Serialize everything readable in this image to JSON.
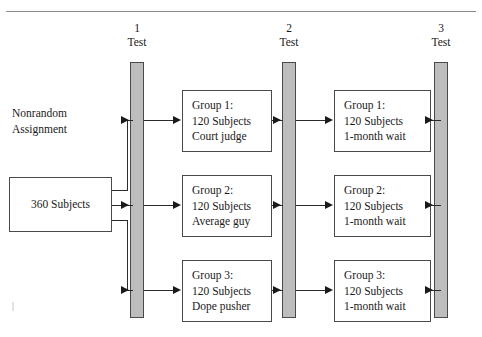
{
  "page": {
    "ghost_text": "                                        "
  },
  "columns": [
    {
      "number": "1",
      "label": "Test"
    },
    {
      "number": "2",
      "label": "Test"
    },
    {
      "number": "3",
      "label": "Test"
    }
  ],
  "left": {
    "assignment_label": "Nonrandom\nAssignment",
    "subjects_box": "360 Subjects"
  },
  "stage1": [
    {
      "line1": "Group 1:",
      "line2": "120 Subjects",
      "line3": "Court judge"
    },
    {
      "line1": "Group 2:",
      "line2": "120 Subjects",
      "line3": "Average guy"
    },
    {
      "line1": "Group 3:",
      "line2": "120 Subjects",
      "line3": "Dope pusher"
    }
  ],
  "stage2": [
    {
      "line1": "Group 1:",
      "line2": "120 Subjects",
      "line3": "1-month wait"
    },
    {
      "line1": "Group 2:",
      "line2": "120 Subjects",
      "line3": "1-month wait"
    },
    {
      "line1": "Group 3:",
      "line2": "120 Subjects",
      "line3": "1-month wait"
    }
  ],
  "colors": {
    "test_bar_fill": "#bdbdbd",
    "box_border": "#4a4a4a",
    "connector": "#2b2b2b",
    "rule": "#8a8a8a"
  }
}
